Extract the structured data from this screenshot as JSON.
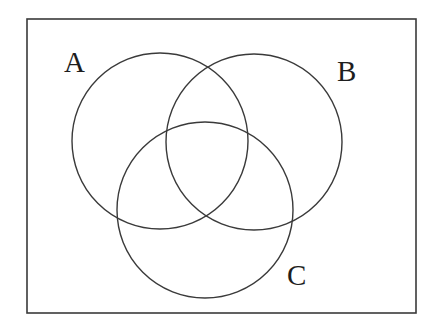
{
  "diagram": {
    "type": "venn",
    "sets": 3,
    "universe_box": {
      "x": 27,
      "y": 19,
      "width": 389,
      "height": 294
    },
    "stroke_color": "#3a3a3a",
    "circles": [
      {
        "id": "A",
        "label": "A",
        "cx": 160,
        "cy": 141,
        "r": 88,
        "label_x": 64,
        "label_y": 72
      },
      {
        "id": "B",
        "label": "B",
        "cx": 254,
        "cy": 142,
        "r": 88,
        "label_x": 337,
        "label_y": 81
      },
      {
        "id": "C",
        "label": "C",
        "cx": 205,
        "cy": 210,
        "r": 88,
        "label_x": 287,
        "label_y": 285
      }
    ]
  },
  "labels": {
    "a": "A",
    "b": "B",
    "c": "C"
  }
}
